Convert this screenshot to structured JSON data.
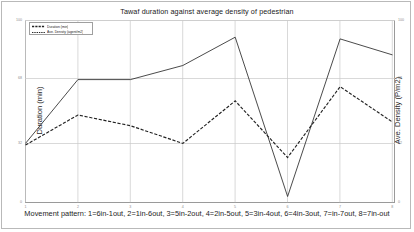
{
  "chart_data": {
    "type": "line",
    "title": "Tawaf duration against average density of pedestrian",
    "xlabel": "Movement pattern: 1=6in-1out, 2=1in-6out, 3=5in-2out, 4=2in-5out, 5=3in-4out, 6=4in-3out, 7=in-7out, 8=7in-out",
    "ylabel": "Duration (min)",
    "y2label": "Ave. Density (P/m2)",
    "categories": [
      "1",
      "2",
      "3",
      "4",
      "5",
      "6",
      "7",
      "8"
    ],
    "x": [
      1,
      2,
      3,
      4,
      5,
      6,
      7,
      8
    ],
    "grid": true,
    "legend_position": "upper-left",
    "ylim": [
      0,
      100
    ],
    "y2lim": [
      0,
      100
    ],
    "yticks": [
      0,
      32,
      68,
      100
    ],
    "y2ticks": [
      0,
      32,
      68,
      100
    ],
    "series": [
      {
        "name": "Duration (min)",
        "axis": "left",
        "style": "solid",
        "color": "#2a2a2a",
        "values": [
          32,
          68,
          68,
          76,
          92,
          2,
          91,
          82
        ]
      },
      {
        "name": "Ave. Density (agent/m2)",
        "axis": "right",
        "style": "dashed",
        "color": "#222222",
        "values": [
          31,
          48,
          42,
          32,
          56,
          24,
          64,
          44
        ]
      }
    ]
  },
  "legend": {
    "items": [
      {
        "label": "Duration (min)",
        "style": "dashed"
      },
      {
        "label": "Ave. Density (agent/m2)",
        "style": "dashed"
      }
    ]
  },
  "axes": {
    "left_ticks": [
      "100",
      "68",
      "32",
      "0"
    ],
    "right_ticks": [
      "100",
      "68",
      "32",
      "0"
    ],
    "bottom_ticks": [
      "1",
      "2",
      "3",
      "4",
      "5",
      "6",
      "7",
      "8"
    ]
  }
}
